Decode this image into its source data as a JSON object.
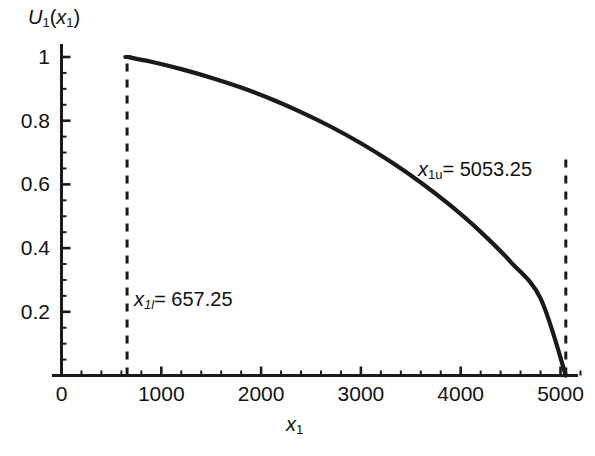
{
  "chart_data": {
    "type": "line",
    "title": "",
    "xlabel": "x1",
    "ylabel": "U1(x1)",
    "xlim": [
      -120,
      5320
    ],
    "ylim": [
      0,
      1.05
    ],
    "grid": false,
    "legend": null,
    "x_ticks": [
      0,
      1000,
      2000,
      3000,
      4000,
      5000
    ],
    "x_tick_labels": [
      "0",
      "1000",
      "2000",
      "3000",
      "4000",
      "5000"
    ],
    "x_minor_tick_step": 200,
    "y_ticks": [
      0.2,
      0.4,
      0.6,
      0.8,
      1
    ],
    "y_tick_labels": [
      "0.2",
      "0.4",
      "0.6",
      "0.8",
      "1"
    ],
    "y_minor_tick_step": 0.05,
    "series": [
      {
        "name": "U1(x1)",
        "color": "#1a1a1a",
        "x": [
          657.25,
          900,
          1200,
          1500,
          1800,
          2100,
          2400,
          2700,
          3000,
          3300,
          3600,
          3900,
          4200,
          4500,
          4800,
          5053.25
        ],
        "values": [
          1.0,
          0.985,
          0.962,
          0.935,
          0.904,
          0.868,
          0.827,
          0.781,
          0.729,
          0.671,
          0.606,
          0.533,
          0.451,
          0.357,
          0.242,
          0.0
        ]
      }
    ],
    "annotations": [
      {
        "name": "lower-bound",
        "text": "x1l = 657.25",
        "var": "x",
        "subscript": "1l",
        "value": "657.25",
        "x": 657.25,
        "line_style": "dashed",
        "line_from_y": 0,
        "line_to_y": 1.0
      },
      {
        "name": "upper-bound",
        "text": "x1u = 5053.25",
        "var": "x",
        "subscript": "1u",
        "value": "5053.25",
        "x": 5053.25,
        "line_style": "dashed",
        "line_from_y": 0,
        "line_to_y": 0.7
      }
    ]
  },
  "axes": {
    "y_label_var": "U",
    "y_label_sub": "1",
    "y_label_arg_var": "x",
    "y_label_arg_sub": "1",
    "x_label_var": "x",
    "x_label_sub": "1"
  },
  "annotation_text": {
    "lower_var": "x",
    "lower_sub": "1l",
    "lower_eq": "= 657.25",
    "upper_var": "x",
    "upper_sub": "1u",
    "upper_eq": "= 5053.25"
  },
  "colors": {
    "curve": "#1a1a1a",
    "axis": "#1a1a1a",
    "background": "#ffffff"
  }
}
